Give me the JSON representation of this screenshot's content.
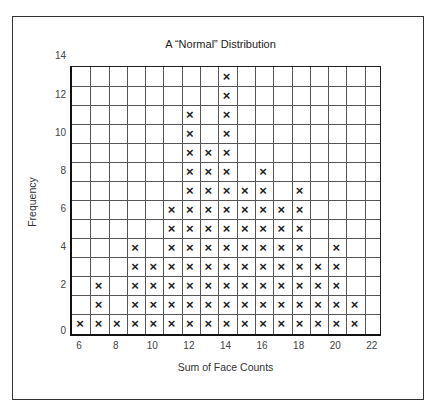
{
  "chart_data": {
    "type": "dot_plot",
    "title": "A “Normal” Distribution",
    "xlabel": "Sum of Face Counts",
    "ylabel": "Frequency",
    "marker": "×",
    "categories": [
      6,
      7,
      8,
      9,
      10,
      11,
      12,
      13,
      14,
      15,
      16,
      17,
      18,
      19,
      20,
      21,
      22
    ],
    "values": [
      1,
      3,
      1,
      5,
      4,
      7,
      12,
      10,
      14,
      8,
      9,
      7,
      8,
      4,
      5,
      2,
      0
    ],
    "x_tick_labels": [
      "6",
      "8",
      "10",
      "12",
      "14",
      "16",
      "18",
      "20",
      "22"
    ],
    "y_tick_labels": [
      "0",
      "2",
      "4",
      "6",
      "8",
      "10",
      "12",
      "14"
    ],
    "xlim": [
      6,
      22
    ],
    "ylim": [
      0,
      14
    ],
    "grid": true,
    "legend": null
  }
}
